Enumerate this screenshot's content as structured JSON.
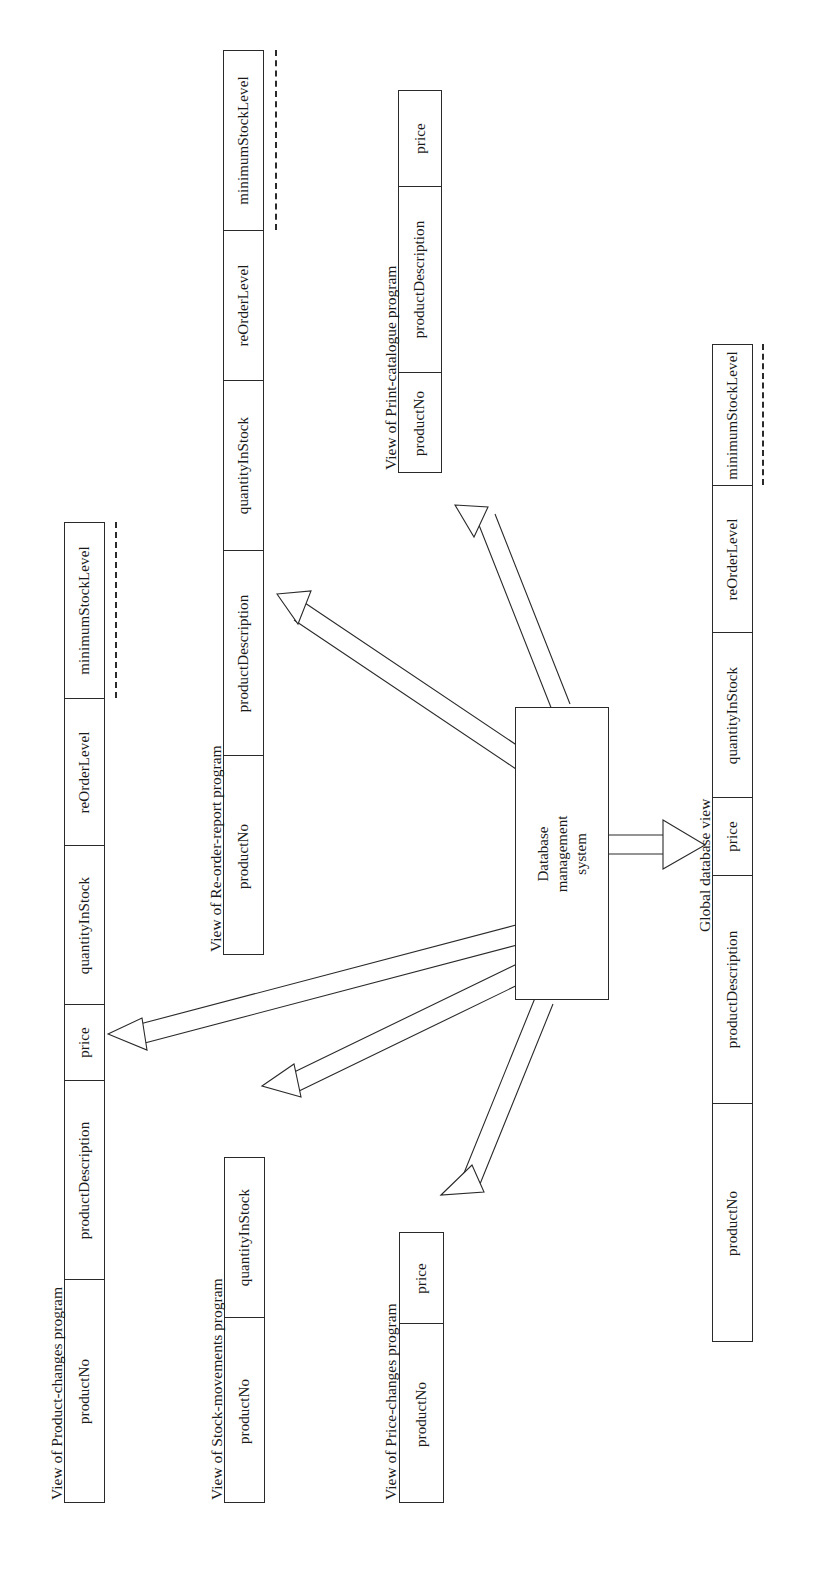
{
  "diagram": {
    "type": "database-architecture-diagram",
    "orientation": "rotated-90-counterclockwise",
    "central_component": {
      "label_line1": "Database",
      "label_line2": "management",
      "label_line3": "system",
      "full_label": "Database management system"
    },
    "global_view": {
      "caption": "Global database view",
      "fields": [
        "productNo",
        "productDescription",
        "price",
        "quantityInStock",
        "reOrderLevel",
        "minimumStockLevel"
      ],
      "has_continuation": true
    },
    "views": [
      {
        "id": "product-changes",
        "caption": "View of Product-changes program",
        "fields": [
          "productNo",
          "productDescription",
          "price",
          "quantityInStock",
          "reOrderLevel",
          "minimumStockLevel"
        ],
        "has_continuation": true
      },
      {
        "id": "stock-movements",
        "caption": "View of Stock-movements program",
        "fields": [
          "productNo",
          "quantityInStock"
        ],
        "has_continuation": false
      },
      {
        "id": "price-changes",
        "caption": "View of Price-changes program",
        "fields": [
          "productNo",
          "price"
        ],
        "has_continuation": false
      },
      {
        "id": "re-order-report",
        "caption": "View of Re-order-report program",
        "fields": [
          "productNo",
          "productDescription",
          "quantityInStock",
          "reOrderLevel",
          "minimumStockLevel"
        ],
        "has_continuation": true
      },
      {
        "id": "print-catalogue",
        "caption": "View of Print-catalogue program",
        "fields": [
          "productNo",
          "productDescription",
          "price"
        ],
        "has_continuation": false
      }
    ],
    "colors": {
      "line": "#2a2a2a",
      "fill": "#ffffff",
      "text": "#1a1a1a"
    }
  }
}
